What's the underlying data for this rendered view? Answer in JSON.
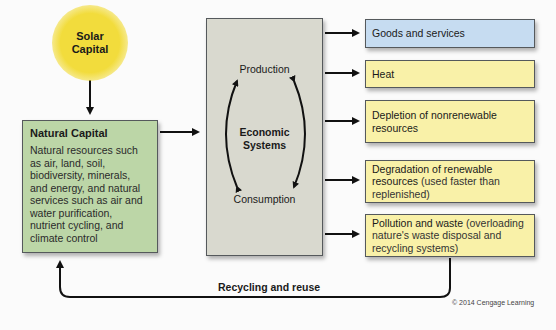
{
  "solar": {
    "line1": "Solar",
    "line2": "Capital"
  },
  "natural_capital": {
    "title": "Natural Capital",
    "description": "Natural resources such as air, land, soil, biodiversity, minerals, and energy, and natural services such as air and water purification, nutrient cycling, and climate control"
  },
  "economic_systems": {
    "production": "Production",
    "consumption": "Consumption",
    "title_line1": "Economic",
    "title_line2": "Systems"
  },
  "outputs": [
    {
      "main": "Goods and services",
      "detail": "",
      "color": "#c6dcf1"
    },
    {
      "main": "Heat",
      "detail": "",
      "color": "#f9f1a8"
    },
    {
      "main": "Depletion of nonrenewable resources",
      "detail": "",
      "color": "#f9f1a8"
    },
    {
      "main": "Degradation of renewable resources",
      "detail": " (used faster than replenished)",
      "color": "#f9f1a8"
    },
    {
      "main": "Pollution and waste",
      "detail": " (overloading nature's waste disposal and recycling systems)",
      "color": "#f9f1a8"
    }
  ],
  "recycling_label": "Recycling and reuse",
  "copyright": "© 2014 Cengage Learning",
  "colors": {
    "solar": "#f2dc3c",
    "natural_capital": "#bcd6a7",
    "economic_systems": "#d9d9cf",
    "goods": "#c6dcf1",
    "impacts": "#f9f1a8"
  }
}
